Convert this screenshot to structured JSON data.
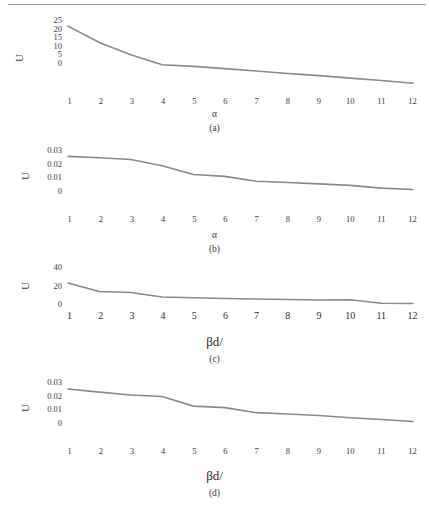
{
  "figure": {
    "line_color": "#8a8a8a",
    "text_color": "#3c3c3c",
    "panels": [
      {
        "caption": "(a)",
        "ylabel": "U",
        "xlabel": "α",
        "yticks": [
          "25",
          "20",
          "15",
          "10",
          "5",
          "0"
        ]
      },
      {
        "caption": "(b)",
        "ylabel": "U",
        "xlabel": "α",
        "yticks": [
          "0.03",
          "0.02",
          "0.01",
          "0"
        ]
      },
      {
        "caption": "(c)",
        "ylabel": "U",
        "xlabel": "βd/",
        "yticks": [
          "40",
          "20",
          "0"
        ]
      },
      {
        "caption": "(d)",
        "ylabel": "U",
        "xlabel": "βd/",
        "yticks": [
          "0.03",
          "0.02",
          "0.01",
          "0"
        ]
      }
    ],
    "xticks": [
      "1",
      "2",
      "3",
      "4",
      "5",
      "6",
      "7",
      "8",
      "9",
      "10",
      "11",
      "12"
    ]
  },
  "chart_data": [
    {
      "type": "line",
      "title": "(a)",
      "xlabel": "α",
      "ylabel": "U",
      "x": [
        1,
        2,
        3,
        4,
        5,
        6,
        7,
        8,
        9,
        10,
        11,
        12
      ],
      "values": [
        22.0,
        16.0,
        11.5,
        7.8,
        7.2,
        6.4,
        5.5,
        4.6,
        3.8,
        2.9,
        2.0,
        1.0
      ],
      "xlim": [
        1,
        12
      ],
      "ylim": [
        0,
        25
      ],
      "ytick_values": [
        25,
        20,
        15,
        10,
        5,
        0
      ],
      "grid": false,
      "legend": false
    },
    {
      "type": "line",
      "title": "(b)",
      "xlabel": "α",
      "ylabel": "U",
      "x": [
        1,
        2,
        3,
        4,
        5,
        6,
        7,
        8,
        9,
        10,
        11,
        12
      ],
      "values": [
        0.0255,
        0.0248,
        0.0238,
        0.0205,
        0.0158,
        0.0148,
        0.0122,
        0.0115,
        0.0108,
        0.01,
        0.0085,
        0.0078
      ],
      "xlim": [
        1,
        12
      ],
      "ylim": [
        0,
        0.03
      ],
      "ytick_values": [
        0.03,
        0.02,
        0.01,
        0
      ],
      "grid": false,
      "legend": false
    },
    {
      "type": "line",
      "title": "(c)",
      "xlabel": "βd/",
      "ylabel": "U",
      "x": [
        1,
        2,
        3,
        4,
        5,
        6,
        7,
        8,
        9,
        10,
        11,
        12
      ],
      "values": [
        22.0,
        13.5,
        12.5,
        8.0,
        7.2,
        6.5,
        6.0,
        5.5,
        5.0,
        5.2,
        1.8,
        1.5
      ],
      "xlim": [
        1,
        12
      ],
      "ylim": [
        0,
        40
      ],
      "ytick_values": [
        40,
        20,
        0
      ],
      "grid": false,
      "legend": false
    },
    {
      "type": "line",
      "title": "(d)",
      "xlabel": "βd/",
      "ylabel": "U",
      "x": [
        1,
        2,
        3,
        4,
        5,
        6,
        7,
        8,
        9,
        10,
        11,
        12
      ],
      "values": [
        0.0252,
        0.0235,
        0.022,
        0.0212,
        0.016,
        0.0152,
        0.0125,
        0.0118,
        0.011,
        0.0098,
        0.0088,
        0.0078
      ],
      "xlim": [
        1,
        12
      ],
      "ylim": [
        0,
        0.03
      ],
      "ytick_values": [
        0.03,
        0.02,
        0.01,
        0
      ],
      "grid": false,
      "legend": false
    }
  ]
}
